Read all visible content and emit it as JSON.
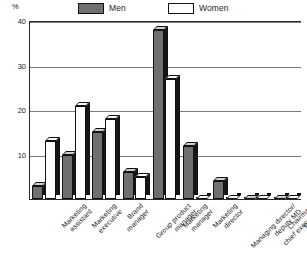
{
  "legend": {
    "entries": [
      {
        "label": "Men",
        "key": "men",
        "color": "#6f6f6f"
      },
      {
        "label": "Women",
        "key": "women",
        "color": "#ffffff"
      }
    ]
  },
  "axis": {
    "unit_label": "%",
    "ticks": [
      "40",
      "30",
      "20",
      "10"
    ]
  },
  "chart_data": {
    "type": "bar",
    "title": "",
    "xlabel": "",
    "ylabel": "%",
    "ylim": [
      0,
      40
    ],
    "yticks": [
      10,
      20,
      30,
      40
    ],
    "grid": true,
    "legend_position": "top",
    "style": "3d-grouped-column",
    "categories": [
      "Marketing\nassistant",
      "Marketing\nexecutive",
      "Brand\nmanager",
      "Group product\nmanager",
      "Marketing\nmanager",
      "Marketing\ndirector",
      "Managing director/\ndeputy MD",
      "Chairman/\nchief executive",
      "Proprietor"
    ],
    "series": [
      {
        "name": "Men",
        "values": [
          3,
          10,
          15,
          6,
          38,
          12,
          4,
          0,
          0
        ]
      },
      {
        "name": "Women",
        "values": [
          13,
          21,
          18,
          5,
          27,
          0,
          0,
          0,
          0
        ]
      }
    ]
  }
}
